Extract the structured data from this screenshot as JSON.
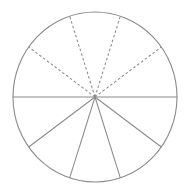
{
  "figure": {
    "background_color": "#ffffff",
    "stroke_color": "#8a8a8a"
  },
  "chart_data": {
    "type": "pie",
    "xlabel": "",
    "ylabel": "",
    "categories": [
      "Sector 1",
      "Sector 2",
      "Sector 3",
      "Sector 4",
      "Sector 5",
      "Sector 6",
      "Sector 7",
      "Sector 8",
      "Sector 9",
      "Sector 10"
    ],
    "values": [
      36,
      36,
      36,
      36,
      36,
      36,
      36,
      36,
      36,
      36
    ],
    "unit": "degrees",
    "slice_count": 10,
    "slice_angle_degrees": 36,
    "total_degrees": 360,
    "grid": false,
    "legend": "none"
  },
  "geometry": {
    "center": {
      "x": 95,
      "y": 97
    },
    "radius_x": 82,
    "radius_y": 85,
    "circle": {
      "left": 13,
      "right": 177,
      "top": 12,
      "bottom": 182
    },
    "diameter": {
      "x1": 13,
      "y1": 97,
      "x2": 177,
      "y2": 97,
      "style": "solid"
    },
    "upper_radii": [
      {
        "label": "upper-radius-1",
        "angle_degrees": 36,
        "x2": 161.3,
        "y2": 47.0,
        "style": "dashed"
      },
      {
        "label": "upper-radius-2",
        "angle_degrees": 72,
        "x2": 120.3,
        "y2": 16.2,
        "style": "dashed"
      },
      {
        "label": "upper-radius-3",
        "angle_degrees": 108,
        "x2": 69.7,
        "y2": 16.2,
        "style": "dashed"
      },
      {
        "label": "upper-radius-4",
        "angle_degrees": 144,
        "x2": 28.7,
        "y2": 47.0,
        "style": "dashed"
      }
    ],
    "lower_radii": [
      {
        "label": "lower-radius-1",
        "angle_degrees": 216,
        "x2": 28.7,
        "y2": 147.0,
        "style": "solid"
      },
      {
        "label": "lower-radius-2",
        "angle_degrees": 252,
        "x2": 69.7,
        "y2": 177.8,
        "style": "solid"
      },
      {
        "label": "lower-radius-3",
        "angle_degrees": 288,
        "x2": 120.3,
        "y2": 177.8,
        "style": "solid"
      },
      {
        "label": "lower-radius-4",
        "angle_degrees": 324,
        "x2": 161.3,
        "y2": 147.0,
        "style": "solid"
      }
    ]
  }
}
